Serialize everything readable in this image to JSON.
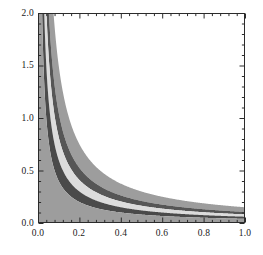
{
  "chart_data": {
    "type": "area",
    "title": "",
    "xlabel": "",
    "ylabel": "",
    "xlim": [
      0.0,
      1.0
    ],
    "ylim": [
      0.0,
      2.0
    ],
    "grid": false,
    "legend": null,
    "frame": true,
    "ticks": {
      "x_major": [
        "0.0",
        "0.2",
        "0.4",
        "0.6",
        "0.8",
        "1.0"
      ],
      "x_major_values": [
        0.0,
        0.2,
        0.4,
        0.6,
        0.8,
        1.0
      ],
      "x_minor_count_per_interval": 4,
      "y_major": [
        "0.0",
        "0.5",
        "1.0",
        "1.5",
        "2.0"
      ],
      "y_major_values": [
        0.0,
        0.5,
        1.0,
        1.5,
        2.0
      ],
      "y_minor_count_per_interval": 4
    },
    "curves": [
      {
        "name": "upper-outer",
        "form": "c/x",
        "c": 0.15
      },
      {
        "name": "upper-inner",
        "form": "c/x",
        "c": 0.105
      },
      {
        "name": "middle",
        "form": "c/x",
        "c": 0.082
      },
      {
        "name": "lower-inner",
        "form": "c/x",
        "c": 0.06
      },
      {
        "name": "lower-outer",
        "form": "c/x",
        "c": 0.04
      }
    ],
    "regions": [
      {
        "name": "outer-light-band",
        "between": [
          "upper-outer",
          "upper-inner"
        ],
        "color": "#9d9d9d"
      },
      {
        "name": "upper-dark-band",
        "between": [
          "upper-inner",
          "middle"
        ],
        "color": "#565656"
      },
      {
        "name": "center-pale-band",
        "between": [
          "middle",
          "lower-inner"
        ],
        "color": "#dcdcdc"
      },
      {
        "name": "lower-dark-band",
        "between": [
          "lower-inner",
          "lower-outer"
        ],
        "color": "#4a4a4a"
      },
      {
        "name": "base-fill",
        "between": [
          "lower-outer",
          "y=0"
        ],
        "color": "#9d9d9d"
      }
    ],
    "colors": {
      "background": "#ffffff",
      "frame": "#2b2b2b",
      "tick": "#2b2b2b",
      "label": "#1a1a1a",
      "light_gray": "#9d9d9d",
      "dark_gray": "#565656",
      "darker_gray": "#4a4a4a",
      "pale_gray": "#dcdcdc"
    },
    "geometry": {
      "plot_left": 38,
      "plot_top": 13,
      "plot_right": 245,
      "plot_bottom": 223
    }
  }
}
